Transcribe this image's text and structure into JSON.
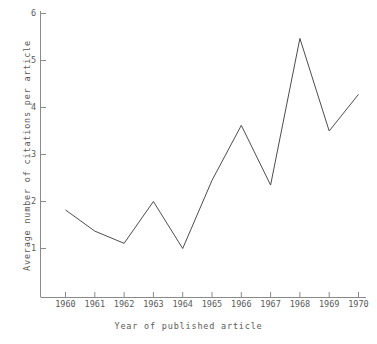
{
  "chart_data": {
    "type": "line",
    "title": "",
    "subtitle": "",
    "xlabel": "Year of published article",
    "ylabel": "Average number of citations per article",
    "categories": [
      1960,
      1961,
      1962,
      1963,
      1964,
      1965,
      1966,
      1967,
      1968,
      1969,
      1970
    ],
    "x": [
      1960,
      1961,
      1962,
      1963,
      1964,
      1965,
      1966,
      1967,
      1968,
      1969,
      1970
    ],
    "values": [
      1.82,
      1.37,
      1.11,
      2.0,
      1.0,
      2.45,
      3.62,
      2.35,
      5.47,
      3.5,
      4.28
    ],
    "series": [
      {
        "name": "Average citations per article",
        "values": [
          1.82,
          1.37,
          1.11,
          2.0,
          1.0,
          2.45,
          3.62,
          2.35,
          5.47,
          3.5,
          4.28
        ]
      }
    ],
    "xlim": [
      1959.5,
      1970.3
    ],
    "ylim": [
      0,
      6
    ],
    "ytick_labels": [
      "1",
      "2",
      "3",
      "4",
      "5",
      "6"
    ],
    "yticks": [
      1,
      2,
      3,
      4,
      5,
      6
    ],
    "xtick_labels": [
      "1960",
      "1961",
      "1962",
      "1963",
      "1964",
      "1965",
      "1966",
      "1967",
      "1968",
      "1969",
      "1970"
    ],
    "grid": false,
    "legend": false,
    "legend_position": "none",
    "line_color": "#4d4d4d",
    "axis_color": "#808080",
    "background_color": "#ffffff",
    "annotations": []
  },
  "axes": {
    "y_ticks": [
      {
        "label": "6",
        "value": 6
      },
      {
        "label": "5",
        "value": 5
      },
      {
        "label": "4",
        "value": 4
      },
      {
        "label": "3",
        "value": 3
      },
      {
        "label": "2",
        "value": 2
      },
      {
        "label": "1",
        "value": 1
      }
    ],
    "x_ticks": [
      {
        "label": "1960",
        "value": 1960
      },
      {
        "label": "1961",
        "value": 1961
      },
      {
        "label": "1962",
        "value": 1962
      },
      {
        "label": "1963",
        "value": 1963
      },
      {
        "label": "1964",
        "value": 1964
      },
      {
        "label": "1965",
        "value": 1965
      },
      {
        "label": "1966",
        "value": 1966
      },
      {
        "label": "1967",
        "value": 1967
      },
      {
        "label": "1968",
        "value": 1968
      },
      {
        "label": "1969",
        "value": 1969
      },
      {
        "label": "1970",
        "value": 1970
      }
    ]
  }
}
